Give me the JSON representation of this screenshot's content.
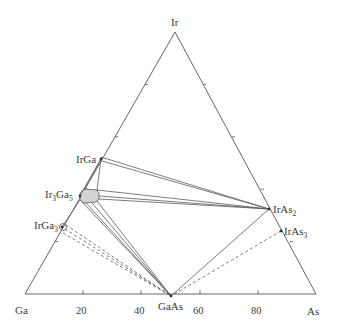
{
  "diagram": {
    "type": "ternary-phase-diagram",
    "vertices": {
      "top": {
        "label": "Ir",
        "x": 175,
        "y": 32
      },
      "left": {
        "label": "Ga",
        "x": 25,
        "y": 294
      },
      "right": {
        "label": "As",
        "x": 316,
        "y": 294
      }
    },
    "bottom_axis_ticks": [
      "20",
      "40",
      "60",
      "80"
    ],
    "phases": [
      {
        "id": "IrGa",
        "label": "IrGa",
        "x": 101,
        "y": 159
      },
      {
        "id": "Ir3Ga5",
        "label_main": "Ir",
        "sub1": "3",
        "label_mid": "Ga",
        "sub2": "5",
        "x": 80,
        "y": 196
      },
      {
        "id": "IrGa3",
        "label_main": "IrGa",
        "sub1": "3",
        "x": 62,
        "y": 227
      },
      {
        "id": "IrAs2",
        "label_main": "IrAs",
        "sub1": "2",
        "x": 269,
        "y": 209
      },
      {
        "id": "IrAs3",
        "label_main": "IrAs",
        "sub1": "3",
        "x": 281,
        "y": 231
      },
      {
        "id": "GaAs",
        "label": "GaAs",
        "x": 171,
        "y": 296
      }
    ],
    "labels": {
      "ir": "Ir",
      "ga": "Ga",
      "as": "As",
      "irga": "IrGa",
      "ir3ga5_a": "Ir",
      "ir3ga5_s1": "3",
      "ir3ga5_b": "Ga",
      "ir3ga5_s2": "5",
      "irga3_a": "IrGa",
      "irga3_s": "3",
      "iras2_a": "IrAs",
      "iras2_s": "2",
      "iras3_a": "IrAs",
      "iras3_s": "3",
      "gaas": "GaAs",
      "t20": "20",
      "t40": "40",
      "t60": "60",
      "t80": "80"
    },
    "colors": {
      "line": "#555555",
      "region_fill": "#d3d3d3",
      "text": "#3a3a3a"
    }
  }
}
